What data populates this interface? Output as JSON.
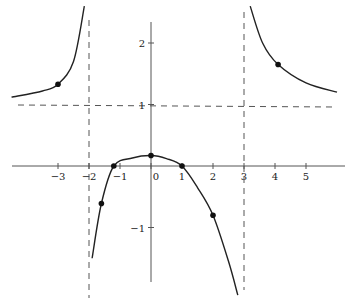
{
  "chart_data": {
    "type": "line",
    "title": "",
    "xlabel": "",
    "ylabel": "",
    "xlim": [
      -4.5,
      6
    ],
    "ylim": [
      -2,
      2.6
    ],
    "grid": false,
    "legend": null,
    "x_ticks": [
      -3,
      -2,
      -1,
      0,
      1,
      2,
      3,
      4,
      5
    ],
    "x_tick_labels": [
      "−3",
      "−2",
      "−1",
      "0",
      "1",
      "2",
      "3",
      "4",
      "5"
    ],
    "y_ticks": [
      2,
      1,
      -1
    ],
    "y_tick_labels": [
      "2",
      "1",
      "−1"
    ],
    "asymptotes": {
      "vertical": [
        -2,
        3
      ],
      "horizontal": [
        1
      ]
    },
    "series": [
      {
        "name": "f(x)",
        "description": "rational function with vertical asymptotes x=-2 and x=3, horizontal asymptote y=1",
        "branches": [
          {
            "domain": "x < -2",
            "points": [
              [
                -4.5,
                1.12
              ],
              [
                -3.5,
                1.22
              ],
              [
                -3,
                1.33
              ],
              [
                -2.5,
                1.7
              ],
              [
                -2.15,
                2.6
              ]
            ]
          },
          {
            "domain": "-2 < x < 3",
            "points": [
              [
                -1.9,
                -1.5
              ],
              [
                -1.6,
                -0.61
              ],
              [
                -1.2,
                0
              ],
              [
                -0.6,
                0.13
              ],
              [
                0,
                0.17
              ],
              [
                0.5,
                0.12
              ],
              [
                1,
                0
              ],
              [
                1.5,
                -0.35
              ],
              [
                2,
                -0.8
              ],
              [
                2.5,
                -1.55
              ],
              [
                2.8,
                -2.1
              ]
            ]
          },
          {
            "domain": "x > 3",
            "points": [
              [
                3.2,
                2.6
              ],
              [
                3.6,
                2.0
              ],
              [
                4.1,
                1.65
              ],
              [
                5,
                1.35
              ],
              [
                6,
                1.2
              ]
            ]
          }
        ]
      }
    ],
    "marked_points": [
      {
        "x": -3,
        "y": 1.33
      },
      {
        "x": -1.6,
        "y": -0.61
      },
      {
        "x": -1.2,
        "y": 0
      },
      {
        "x": 0,
        "y": 0.17
      },
      {
        "x": 1,
        "y": 0
      },
      {
        "x": 2,
        "y": -0.8
      },
      {
        "x": 4.1,
        "y": 1.65
      }
    ]
  }
}
